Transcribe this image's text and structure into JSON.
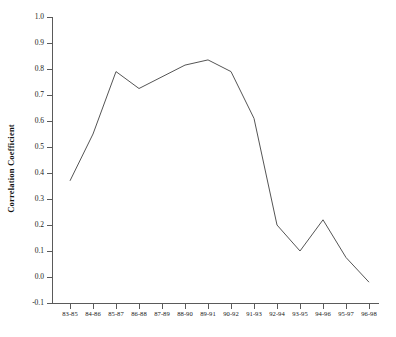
{
  "chart_data": {
    "type": "line",
    "title": "",
    "xlabel": "",
    "ylabel": "Correlation Coefficient",
    "categories": [
      "83-85",
      "84-86",
      "85-87",
      "86-88",
      "87-89",
      "88-90",
      "89-91",
      "90-92",
      "91-93",
      "92-94",
      "93-95",
      "94-96",
      "95-97",
      "96-98"
    ],
    "values": [
      0.37,
      0.55,
      0.79,
      0.725,
      0.77,
      0.815,
      0.835,
      0.79,
      0.61,
      0.2,
      0.1,
      0.22,
      0.075,
      -0.02
    ],
    "ylim": [
      -0.1,
      1.0
    ],
    "ytick_labels": [
      "1.0",
      "0.9",
      "0.8",
      "0.7",
      "0.6",
      "0.5",
      "0.4",
      "0.3",
      "0.2",
      "0.1",
      "0.0",
      "-0.1"
    ],
    "ytick_values": [
      1.0,
      0.9,
      0.8,
      0.7,
      0.6,
      0.5,
      0.4,
      0.3,
      0.2,
      0.1,
      0.0,
      -0.1
    ],
    "grid": false,
    "legend": "none",
    "series": [
      {
        "name": "Correlation Coefficient",
        "color": "#555555",
        "values": [
          0.37,
          0.55,
          0.79,
          0.725,
          0.77,
          0.815,
          0.835,
          0.79,
          0.61,
          0.2,
          0.1,
          0.22,
          0.075,
          -0.02
        ]
      }
    ]
  },
  "axes": {
    "y_axis_title": "Correlation Coefficient"
  },
  "colors": {
    "line": "#555555",
    "axis": "#5a5a5a",
    "text": "#1a1a1a",
    "background": "#ffffff"
  }
}
